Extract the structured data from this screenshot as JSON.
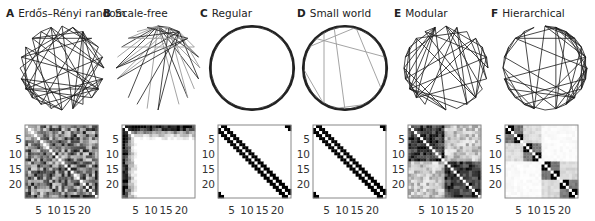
{
  "figure": {
    "node_count": 24,
    "panels": [
      {
        "letter": "A",
        "title": "Erdős–Rényi random",
        "type": "random",
        "seed": 11
      },
      {
        "letter": "B",
        "title": "Scale-free",
        "type": "scalefree",
        "seed": 23
      },
      {
        "letter": "C",
        "title": "Regular",
        "type": "regular",
        "seed": 5
      },
      {
        "letter": "D",
        "title": "Small world",
        "type": "smallworld",
        "seed": 7
      },
      {
        "letter": "E",
        "title": "Modular",
        "type": "modular",
        "seed": 31
      },
      {
        "letter": "F",
        "title": "Hierarchical",
        "type": "hierarchical",
        "seed": 41
      }
    ],
    "matrix_ticks": {
      "y": [
        "5",
        "10",
        "15",
        "20"
      ],
      "x": [
        "5",
        "10",
        "15",
        "20"
      ]
    }
  },
  "colors": {
    "edge": "#1a1a1a",
    "edge_light": "#9a9a9a",
    "matrix_frame": "#888888",
    "text": "#222222"
  }
}
